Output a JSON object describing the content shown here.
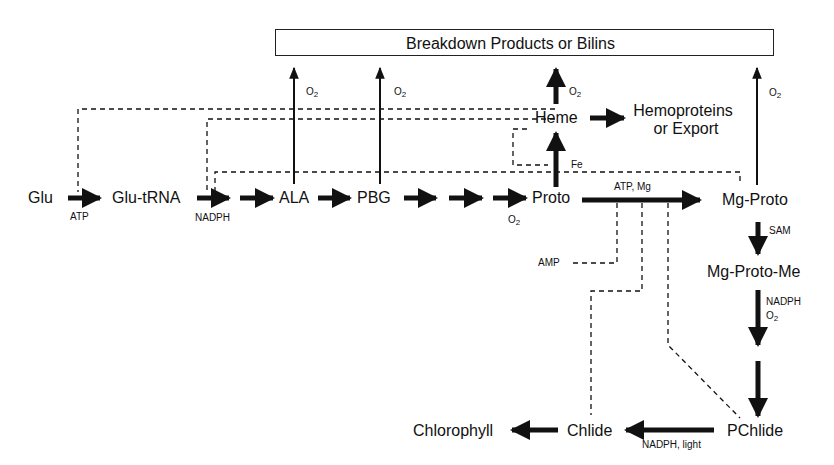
{
  "box": {
    "label": "Breakdown Products or Bilins"
  },
  "nodes": {
    "glu": "Glu",
    "glu_trna": "Glu-tRNA",
    "ala": "ALA",
    "pbg": "PBG",
    "proto": "Proto",
    "heme": "Heme",
    "hemoproteins_line1": "Hemoproteins",
    "hemoproteins_line2": "or Export",
    "mg_proto": "Mg-Proto",
    "mg_proto_me": "Mg-Proto-Me",
    "pchlide": "PChlide",
    "chlide": "Chlide",
    "chlorophyll": "Chlorophyll"
  },
  "labels": {
    "atp": "ATP",
    "nadph": "NADPH",
    "o2": "O",
    "o2_sub": "2",
    "fe": "Fe",
    "atp_mg": "ATP, Mg",
    "amp": "AMP",
    "sam": "SAM",
    "nadph_o2_line1": "NADPH",
    "nadph_light": "NADPH, light"
  },
  "colors": {
    "ink": "#111111",
    "background": "#ffffff"
  }
}
